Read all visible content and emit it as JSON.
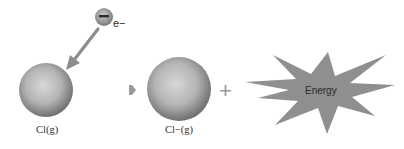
{
  "diagram": {
    "type": "process",
    "electron": {
      "label": "e−",
      "symbol": "−"
    },
    "reactant": {
      "label": "Cl(g)"
    },
    "product": {
      "label": "Cl−(g)"
    },
    "operator": "+",
    "energy": {
      "label": "Energy"
    },
    "colors": {
      "sphere_light": "#d6d6d6",
      "sphere_dark": "#6e6e6e",
      "arrow": "#8c8c8c",
      "star": "#8f8f8f",
      "text": "#333333"
    }
  }
}
